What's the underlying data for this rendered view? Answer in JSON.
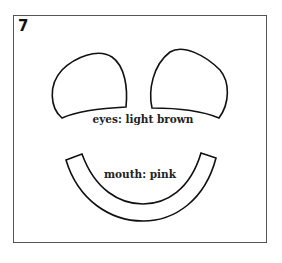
{
  "figure": {
    "number": "7",
    "eyes_label": "eyes: light brown",
    "mouth_label": "mouth: pink"
  }
}
